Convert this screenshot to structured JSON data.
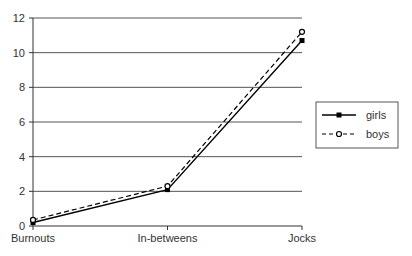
{
  "chart_data": {
    "type": "line",
    "title": "",
    "xlabel": "",
    "ylabel": "",
    "categories": [
      "Burnouts",
      "In-betweens",
      "Jocks"
    ],
    "series": [
      {
        "name": "girls",
        "values": [
          0.2,
          2.1,
          10.7
        ],
        "style": "solid",
        "marker": "filled-square",
        "color": "#000000"
      },
      {
        "name": "boys",
        "values": [
          0.35,
          2.3,
          11.2
        ],
        "style": "dashed",
        "marker": "open-circle",
        "color": "#000000"
      }
    ],
    "ylim": [
      0,
      12
    ],
    "yticks": [
      0,
      2,
      4,
      6,
      8,
      10,
      12
    ],
    "grid": true,
    "legend_position": "right"
  }
}
